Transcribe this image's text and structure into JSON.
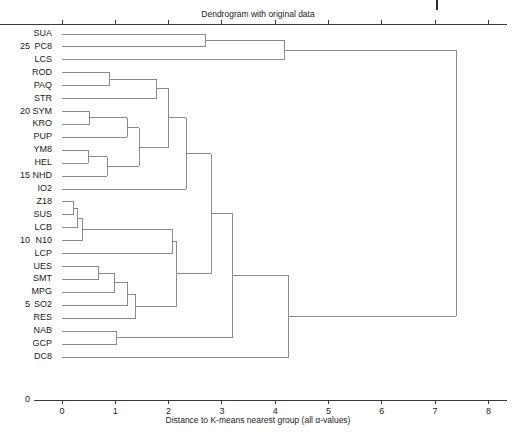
{
  "figure": {
    "title": "Dendrogram with original data",
    "xlabel": "Distance to K-means nearest group (all α-values)",
    "zero_label": "0",
    "axis_color": "#3a3a3a",
    "link_color": "#6e6e6e",
    "background": "#ffffff"
  },
  "xaxis": {
    "ticks": [
      "0",
      "1",
      "2",
      "3",
      "4",
      "5",
      "6",
      "7",
      "8"
    ],
    "min": 0,
    "max": 8
  },
  "leaves": [
    {
      "label": "SUA",
      "num": ""
    },
    {
      "label": "PC8",
      "num": "25"
    },
    {
      "label": "LCS",
      "num": ""
    },
    {
      "label": "ROD",
      "num": ""
    },
    {
      "label": "PAQ",
      "num": ""
    },
    {
      "label": "STR",
      "num": ""
    },
    {
      "label": "SYM",
      "num": "20"
    },
    {
      "label": "KRO",
      "num": ""
    },
    {
      "label": "PUP",
      "num": ""
    },
    {
      "label": "YM8",
      "num": ""
    },
    {
      "label": "HEL",
      "num": ""
    },
    {
      "label": "NHD",
      "num": "15"
    },
    {
      "label": "IO2",
      "num": ""
    },
    {
      "label": "Z18",
      "num": ""
    },
    {
      "label": "SUS",
      "num": ""
    },
    {
      "label": "LCB",
      "num": ""
    },
    {
      "label": "N10",
      "num": "10"
    },
    {
      "label": "LCP",
      "num": ""
    },
    {
      "label": "UES",
      "num": ""
    },
    {
      "label": "SMT",
      "num": ""
    },
    {
      "label": "MPG",
      "num": ""
    },
    {
      "label": "SO2",
      "num": "5"
    },
    {
      "label": "RES",
      "num": ""
    },
    {
      "label": "NAB",
      "num": ""
    },
    {
      "label": "GCP",
      "num": ""
    },
    {
      "label": "DC8",
      "num": ""
    }
  ],
  "chart_data": {
    "type": "dendrogram",
    "title": "Dendrogram with original data",
    "xlabel": "Distance to K-means nearest group (all α-values)",
    "ylabel": "",
    "xlim": [
      0,
      8.5
    ],
    "xticks": [
      0,
      1,
      2,
      3,
      4,
      5,
      6,
      7,
      8
    ],
    "grid": false,
    "legend": null,
    "orientation": "horizontal-left-root-right",
    "leaf_order": [
      "SUA",
      "PC8",
      "LCS",
      "ROD",
      "PAQ",
      "STR",
      "SYM",
      "KRO",
      "PUP",
      "YM8",
      "HEL",
      "NHD",
      "IO2",
      "Z18",
      "SUS",
      "LCB",
      "N10",
      "LCP",
      "UES",
      "SMT",
      "MPG",
      "SO2",
      "RES",
      "NAB",
      "GCP",
      "DC8"
    ],
    "leaf_index_marks": {
      "25": "PC8",
      "20": "SYM",
      "15": "NHD",
      "10": "N10",
      "5": "SO2",
      "0": "baseline"
    },
    "merges": [
      {
        "id": "m1",
        "children": [
          "SUA",
          "PC8"
        ],
        "height": 2.7
      },
      {
        "id": "m2",
        "children": [
          "m1",
          "LCS"
        ],
        "height": 4.18
      },
      {
        "id": "m3",
        "children": [
          "ROD",
          "PAQ"
        ],
        "height": 0.9
      },
      {
        "id": "m4",
        "children": [
          "m3",
          "STR"
        ],
        "height": 1.78
      },
      {
        "id": "m5",
        "children": [
          "SYM",
          "KRO"
        ],
        "height": 0.52
      },
      {
        "id": "m6",
        "children": [
          "m5",
          "PUP"
        ],
        "height": 1.22
      },
      {
        "id": "m7",
        "children": [
          "YM8",
          "HEL"
        ],
        "height": 0.49
      },
      {
        "id": "m8",
        "children": [
          "m7",
          "NHD"
        ],
        "height": 0.85
      },
      {
        "id": "m9",
        "children": [
          "m6",
          "m8"
        ],
        "height": 1.45
      },
      {
        "id": "m10",
        "children": [
          "m4",
          "m9"
        ],
        "height": 2.0
      },
      {
        "id": "m11",
        "children": [
          "m10",
          "IO2"
        ],
        "height": 2.33
      },
      {
        "id": "m12",
        "children": [
          "Z18",
          "SUS"
        ],
        "height": 0.22
      },
      {
        "id": "m13",
        "children": [
          "m12",
          "LCB"
        ],
        "height": 0.3
      },
      {
        "id": "m14",
        "children": [
          "m13",
          "N10"
        ],
        "height": 0.38
      },
      {
        "id": "m15",
        "children": [
          "m14",
          "LCP"
        ],
        "height": 2.07
      },
      {
        "id": "m16",
        "children": [
          "UES",
          "SMT"
        ],
        "height": 0.69
      },
      {
        "id": "m17",
        "children": [
          "m16",
          "MPG"
        ],
        "height": 0.99
      },
      {
        "id": "m18",
        "children": [
          "m17",
          "SO2"
        ],
        "height": 1.23
      },
      {
        "id": "m19",
        "children": [
          "m18",
          "RES"
        ],
        "height": 1.38
      },
      {
        "id": "m20",
        "children": [
          "m15",
          "m19"
        ],
        "height": 2.15
      },
      {
        "id": "m21",
        "children": [
          "m11",
          "m20"
        ],
        "height": 2.8
      },
      {
        "id": "m22",
        "children": [
          "NAB",
          "GCP"
        ],
        "height": 1.03
      },
      {
        "id": "m23",
        "children": [
          "m21",
          "m22"
        ],
        "height": 3.2
      },
      {
        "id": "m24",
        "children": [
          "m23",
          "DC8"
        ],
        "height": 4.25
      },
      {
        "id": "m25",
        "children": [
          "m2",
          "m24"
        ],
        "height": 7.4
      }
    ]
  }
}
